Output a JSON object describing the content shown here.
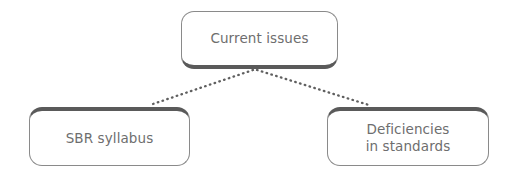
{
  "diagram": {
    "type": "hierarchy-tree",
    "background_color": "#ffffff",
    "node_fill_color": "#ffffff",
    "node_border_color": "#8a8a8a",
    "node_accent_color": "#5a5a5a",
    "text_color": "#6e6e6e",
    "connector_color": "#5f5f5f",
    "connector_style": "dotted",
    "nodes": [
      {
        "id": "current-issues",
        "label": "Current issues",
        "level": 0
      },
      {
        "id": "sbr-syllabus",
        "label": "SBR syllabus",
        "level": 1
      },
      {
        "id": "deficiencies-in-standards",
        "label": "Deficiencies\nin standards",
        "level": 1
      }
    ],
    "connections": [
      {
        "from": "current-issues",
        "to": "sbr-syllabus"
      },
      {
        "from": "current-issues",
        "to": "deficiencies-in-standards"
      }
    ]
  }
}
